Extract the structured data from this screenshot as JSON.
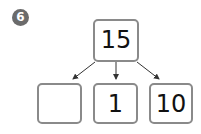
{
  "problem": {
    "number_badge": "6"
  },
  "diagram": {
    "type": "number-decomposition-tree",
    "top": {
      "value": "15"
    },
    "children": [
      {
        "value": ""
      },
      {
        "value": "1"
      },
      {
        "value": "10"
      }
    ],
    "colors": {
      "box_border": "#8a8a8a",
      "arrow": "#333333",
      "badge": "#6b6b6b"
    }
  }
}
